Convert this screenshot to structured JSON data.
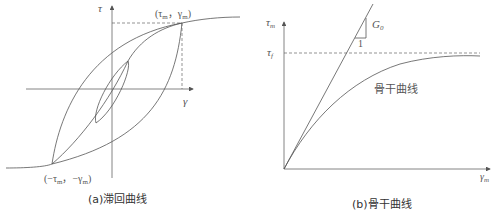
{
  "panel_a": {
    "caption": "(a)滞回曲线",
    "y_axis_label": "τ",
    "x_axis_label": "γ",
    "peak_point_label": {
      "open": "(τ",
      "sub1": "m",
      "sep": "，γ",
      "sub2": "m",
      "close": ")"
    },
    "trough_point_label": {
      "open": "(−τ",
      "sub1": "m",
      "sep": "，−γ",
      "sub2": "m",
      "close": ")"
    }
  },
  "panel_b": {
    "caption": "(b)骨干曲线",
    "y_axis_label": "τ",
    "y_axis_sub": "m",
    "x_axis_label": "γ",
    "x_axis_sub": "m",
    "asymptote_label": "τ",
    "asymptote_sub": "f",
    "slope_label": "G",
    "slope_sub": "0",
    "slope_run_label": "1",
    "curve_label": "骨干曲线"
  },
  "colors": {
    "line": "#555555",
    "text": "#444444"
  }
}
